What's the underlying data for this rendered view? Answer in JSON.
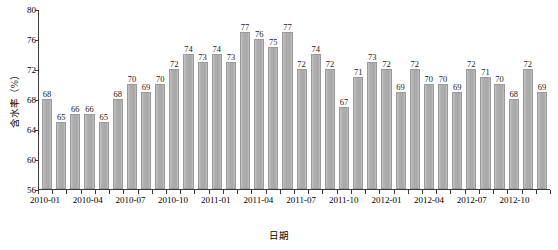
{
  "chart_data": {
    "type": "bar",
    "title": "",
    "xlabel": "日期",
    "ylabel": "含水率（%）",
    "ylim": [
      56,
      80
    ],
    "yticks": [
      56,
      60,
      64,
      68,
      72,
      76,
      80
    ],
    "grid": false,
    "legend": null,
    "bar_color": "#ababab",
    "categories": [
      "2010-01",
      "2010-02",
      "2010-03",
      "2010-04",
      "2010-05",
      "2010-06",
      "2010-07",
      "2010-08",
      "2010-09",
      "2010-10",
      "2010-11",
      "2010-12",
      "2011-01",
      "2011-02",
      "2011-03",
      "2011-04",
      "2011-05",
      "2011-06",
      "2011-07",
      "2011-08",
      "2011-09",
      "2011-10",
      "2011-11",
      "2011-12",
      "2012-01",
      "2012-02",
      "2012-03",
      "2012-04",
      "2012-05",
      "2012-06",
      "2012-07",
      "2012-08",
      "2012-09",
      "2012-10",
      "2012-11",
      "2012-12"
    ],
    "values": [
      68,
      65,
      66,
      66,
      65,
      68,
      70,
      69,
      70,
      72,
      74,
      73,
      74,
      73,
      77,
      76,
      75,
      77,
      72,
      74,
      72,
      67,
      71,
      73,
      72,
      69,
      72,
      70,
      70,
      69,
      72,
      71,
      70,
      68,
      72,
      69
    ],
    "value_labels": [
      "68",
      "65",
      "66",
      "66",
      "65",
      "68",
      "70",
      "69",
      "70",
      "72",
      "74",
      "73",
      "74",
      "73",
      "77",
      "76",
      "75",
      "77",
      "72",
      "74",
      "72",
      "67",
      "71",
      "73",
      "72",
      "69",
      "72",
      "70",
      "70",
      "69",
      "72",
      "71",
      "70",
      "68",
      "72",
      "69"
    ],
    "xtick_labels": [
      "2010-01",
      "2010-04",
      "2010-07",
      "2010-10",
      "2011-01",
      "2011-04",
      "2011-07",
      "2011-10",
      "2012-01",
      "2012-04",
      "2012-07",
      "2012-10"
    ],
    "xtick_indices": [
      0,
      3,
      6,
      9,
      12,
      15,
      18,
      21,
      24,
      27,
      30,
      33
    ]
  }
}
